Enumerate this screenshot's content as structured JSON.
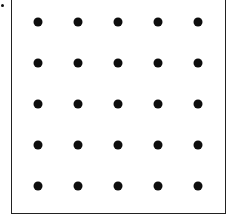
{
  "diagram": {
    "type": "dot-grid",
    "rows": 5,
    "columns": 5,
    "dot_color": "#0d0d0d",
    "border_color": "#222222",
    "column_x": [
      38,
      78,
      118,
      158,
      198
    ],
    "row_y": [
      22,
      63,
      104,
      145,
      186
    ]
  }
}
